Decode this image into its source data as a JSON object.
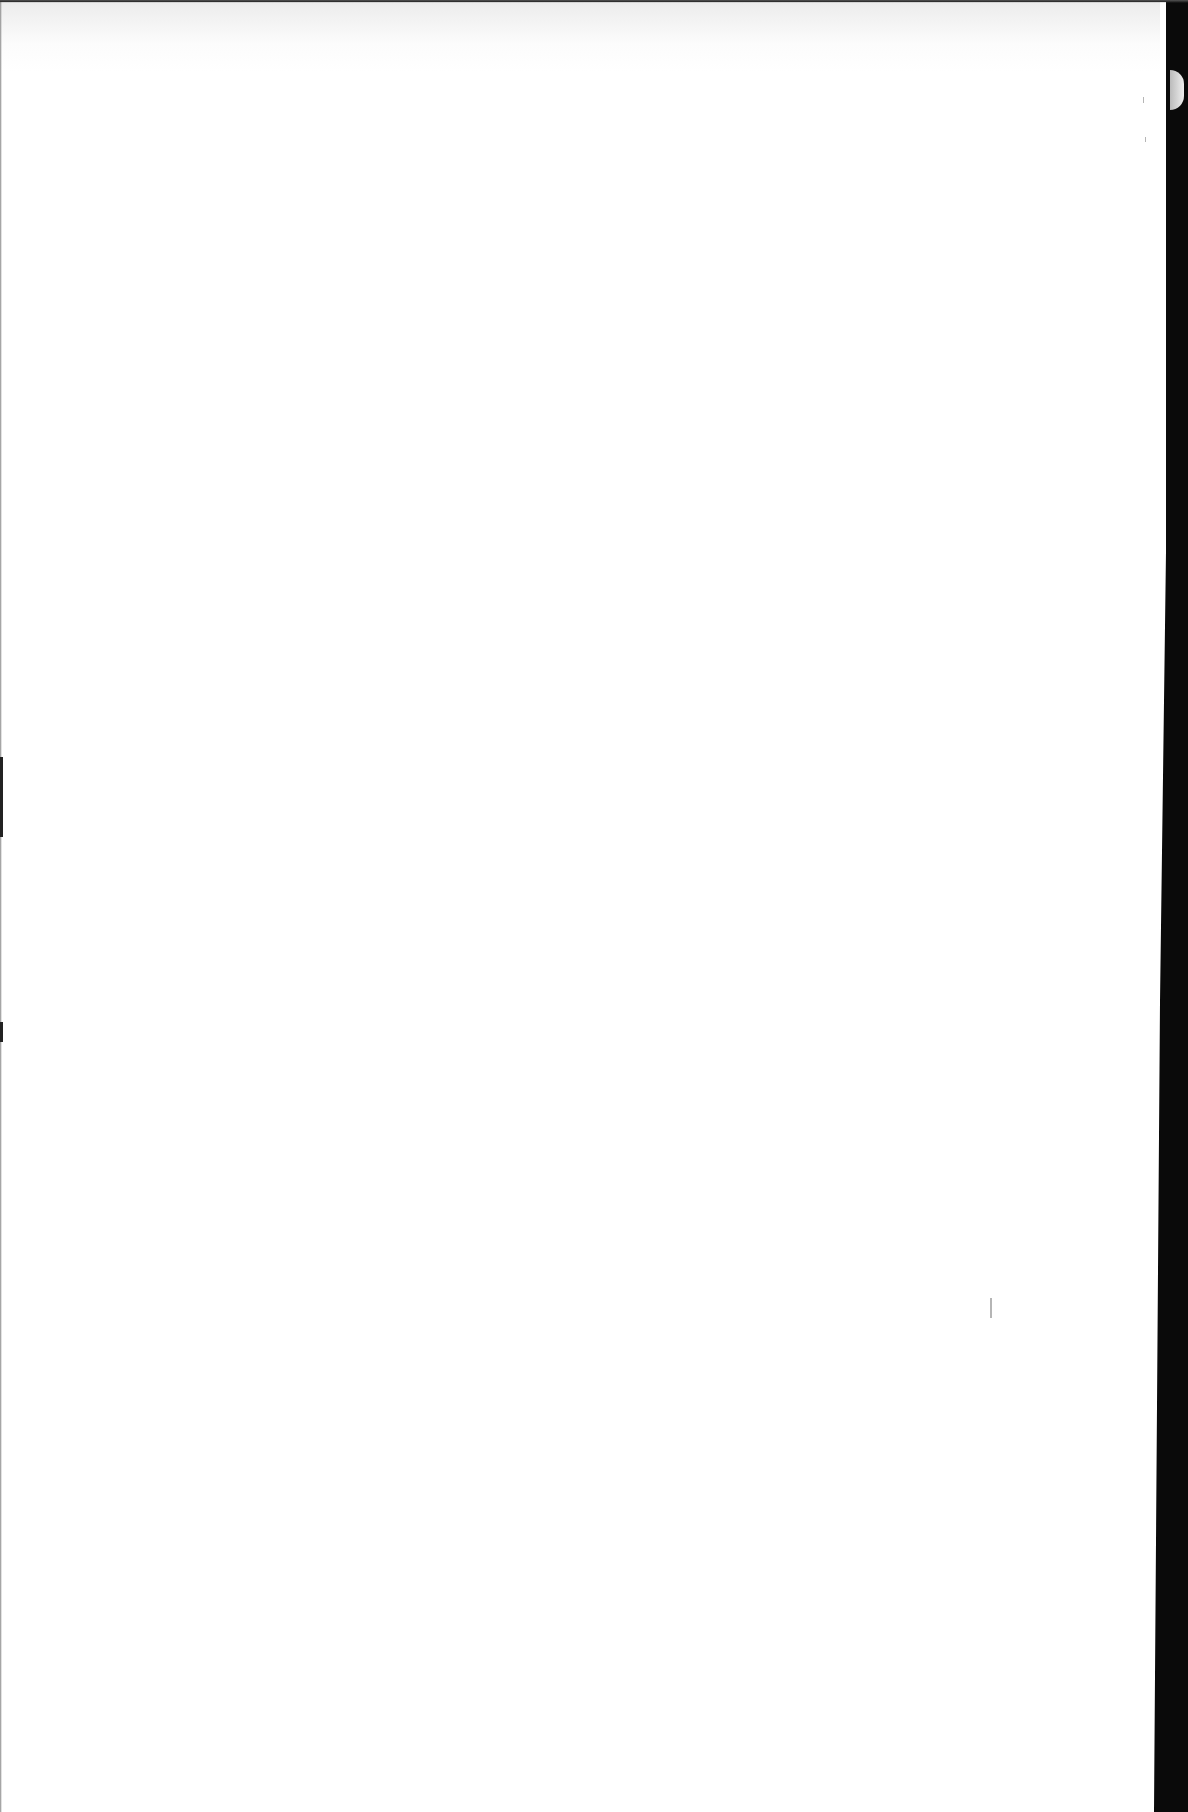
{
  "document": {
    "type": "scanned page",
    "content": "",
    "colors": {
      "paper": "#ffffff",
      "scanner_background": "#0a0a0a",
      "bleed_through": "#c8c8c8"
    }
  }
}
